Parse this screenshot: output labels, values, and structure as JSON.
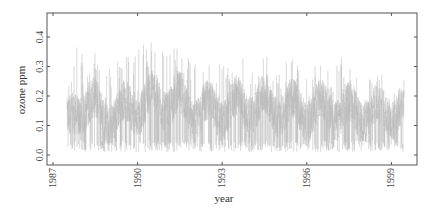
{
  "chart_data": {
    "type": "line",
    "title": "",
    "xlabel": "year",
    "ylabel": "ozone ppm",
    "xlim": [
      1987,
      1999.9
    ],
    "ylim": [
      0.0,
      0.45
    ],
    "x_ticks": [
      "1987",
      "1990",
      "1993",
      "1996",
      "1999"
    ],
    "y_ticks": [
      "0.0",
      "0.1",
      "0.2",
      "0.3",
      "0.4"
    ],
    "grid": false,
    "legend": null,
    "series": [
      {
        "name": "daily ozone",
        "color": "#b8b8b8",
        "x_start": 1987.5,
        "x_end": 1999.45,
        "description": "Dense daily series; yearly envelope (min, typical, max) estimated from plot",
        "yearly_envelope": [
          {
            "year": 1987.5,
            "min": 0.01,
            "mean": 0.1,
            "max": 0.34
          },
          {
            "year": 1988,
            "min": 0.01,
            "mean": 0.18,
            "max": 0.4
          },
          {
            "year": 1989,
            "min": 0.01,
            "mean": 0.13,
            "max": 0.3
          },
          {
            "year": 1990,
            "min": 0.01,
            "mean": 0.17,
            "max": 0.39
          },
          {
            "year": 1991,
            "min": 0.01,
            "mean": 0.19,
            "max": 0.39
          },
          {
            "year": 1992,
            "min": 0.01,
            "mean": 0.15,
            "max": 0.32
          },
          {
            "year": 1993,
            "min": 0.01,
            "mean": 0.15,
            "max": 0.33
          },
          {
            "year": 1994,
            "min": 0.01,
            "mean": 0.17,
            "max": 0.34
          },
          {
            "year": 1995,
            "min": 0.01,
            "mean": 0.16,
            "max": 0.33
          },
          {
            "year": 1996,
            "min": 0.01,
            "mean": 0.15,
            "max": 0.33
          },
          {
            "year": 1997,
            "min": 0.01,
            "mean": 0.15,
            "max": 0.34
          },
          {
            "year": 1998,
            "min": 0.01,
            "mean": 0.14,
            "max": 0.31
          },
          {
            "year": 1999,
            "min": 0.01,
            "mean": 0.15,
            "max": 0.26
          }
        ]
      }
    ]
  }
}
